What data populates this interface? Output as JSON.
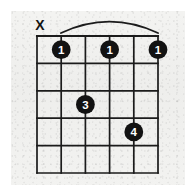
{
  "diagram": {
    "kind": "guitar-chord-diagram",
    "instrument": "guitar",
    "orientation": "vertical",
    "width": 196,
    "height": 194,
    "background_color": "#f1f1ef",
    "ink_color": "#121212",
    "dot_label_color": "#ffffff",
    "string_count": 6,
    "fret_count": 5,
    "grid": {
      "left": 37,
      "right": 158,
      "top": 36,
      "bottom": 173,
      "string_spacing": 24.2,
      "fret_spacing": 27.4
    },
    "barre": {
      "present": true,
      "fret": 1,
      "from_string_index": 1,
      "to_string_index": 5,
      "arc_start_x": 61,
      "arc_end_x": 158,
      "arc_peak_y": 21,
      "arc_base_y": 33
    },
    "open_mute_markers": [
      {
        "string_index": 0,
        "symbol": "X",
        "meaning": "muted",
        "x": 40,
        "y": 25
      }
    ],
    "finger_dots": [
      {
        "label": "1",
        "string_index": 1,
        "fret": 1,
        "cx": 61.2,
        "cy": 49.7,
        "r": 9.4
      },
      {
        "label": "1",
        "string_index": 3,
        "fret": 1,
        "cx": 109.6,
        "cy": 49.7,
        "r": 9.4
      },
      {
        "label": "1",
        "string_index": 5,
        "fret": 1,
        "cx": 158.0,
        "cy": 49.7,
        "r": 9.4
      },
      {
        "label": "3",
        "string_index": 2,
        "fret": 3,
        "cx": 85.4,
        "cy": 104.5,
        "r": 9.4
      },
      {
        "label": "4",
        "string_index": 4,
        "fret": 4,
        "cx": 133.8,
        "cy": 131.9,
        "r": 9.4
      }
    ],
    "string_lines": [
      {
        "x": 37.0
      },
      {
        "x": 61.2
      },
      {
        "x": 85.4
      },
      {
        "x": 109.6
      },
      {
        "x": 133.8
      },
      {
        "x": 158.0
      }
    ],
    "fret_lines": [
      {
        "y": 36.0,
        "is_nut": true
      },
      {
        "y": 63.4,
        "is_nut": false
      },
      {
        "y": 90.8,
        "is_nut": false
      },
      {
        "y": 118.2,
        "is_nut": false
      },
      {
        "y": 145.6,
        "is_nut": false
      },
      {
        "y": 173.0,
        "is_nut": false
      }
    ]
  }
}
